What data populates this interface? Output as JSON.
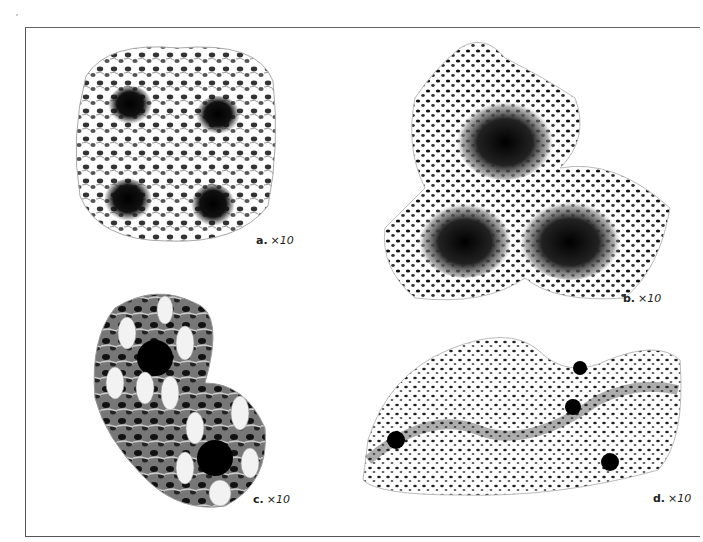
{
  "plate": {
    "panels": [
      {
        "id": "a",
        "letter": "a.",
        "magnification": "×10",
        "description": "coral skeleton with four sunken corallites in porous network"
      },
      {
        "id": "b",
        "letter": "b.",
        "magnification": "×10",
        "description": "three deep cup-shaped corallites in trilobed porous mass"
      },
      {
        "id": "c",
        "letter": "c.",
        "magnification": "×10",
        "description": "encrusting colony with white spiny papillae and two calices"
      },
      {
        "id": "d",
        "letter": "d.",
        "magnification": "×10",
        "description": "undulating porous surface with scattered star-shaped calices"
      }
    ]
  },
  "colors": {
    "ink": "#111111",
    "paper": "#ffffff",
    "frame": "#555555"
  }
}
